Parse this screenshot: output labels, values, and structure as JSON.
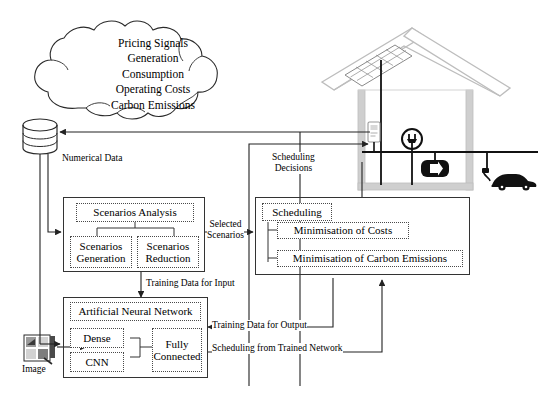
{
  "figure": {
    "type": "flow-diagram"
  },
  "cloud": {
    "name": "data-sources-cloud",
    "lines": [
      "Pricing Signals",
      "Generation",
      "Consumption",
      "Operating Costs",
      "Carbon Emissions"
    ]
  },
  "database": {
    "name": "numerical-database",
    "label": "Numerical Data"
  },
  "image_source": {
    "name": "image-source",
    "label": "Image"
  },
  "scenarios_panel": {
    "name": "scenarios-panel",
    "header": "Scenarios Analysis",
    "children": [
      "Scenarios Generation",
      "Scenarios Reduction"
    ]
  },
  "scheduling_panel": {
    "name": "scheduling-panel",
    "header": "Scheduling",
    "children": [
      "Minimisation of Costs",
      "Minimisation of Carbon Emissions"
    ]
  },
  "ann_panel": {
    "name": "neural-network-panel",
    "header": "Artificial Neural Network",
    "children": [
      "Dense",
      "CNN",
      "Fully Connected"
    ]
  },
  "edges": {
    "selected_scenarios": "Selected\nScenarios",
    "selected_scenarios_l1": "Selected",
    "selected_scenarios_l2": "Scenarios",
    "training_input": "Training Data for Input",
    "training_output": "Training Data for Output",
    "scheduling_trained": "Scheduling from Trained Network",
    "scheduling_decisions_l1": "Scheduling",
    "scheduling_decisions_l2": "Decisions"
  },
  "house": {
    "name": "smart-home-illustration",
    "elements": [
      "solar-panel-icon",
      "smart-meter-icon",
      "plug-socket-icon",
      "battery-icon",
      "electric-car-icon"
    ]
  },
  "colors": {
    "line": "#333333",
    "dotted": "#4a4a4a",
    "house_wall": "#b3b3b3",
    "house_dark": "#111111",
    "background": "#ffffff"
  }
}
